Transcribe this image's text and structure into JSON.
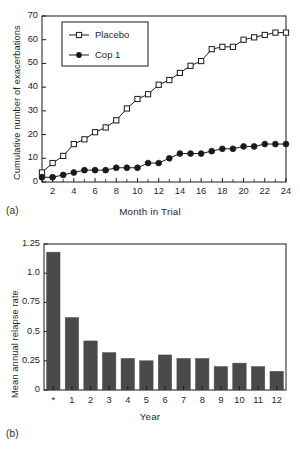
{
  "figure": {
    "panels": [
      {
        "id": "a",
        "label": "(a)"
      },
      {
        "id": "b",
        "label": "(b)"
      }
    ]
  },
  "chart_data": [
    {
      "type": "line",
      "panel": "(a)",
      "title": "",
      "xlabel": "Month in Trial",
      "ylabel": "Cumulative number of exacerbations",
      "xlim": [
        1,
        24
      ],
      "ylim": [
        0,
        70
      ],
      "ytick_values": [
        0,
        10,
        20,
        30,
        40,
        50,
        60,
        70
      ],
      "ytick_labels": [
        "0",
        "10",
        "20",
        "30",
        "40",
        "50",
        "60",
        "70"
      ],
      "xtick_values": [
        2,
        4,
        6,
        8,
        10,
        12,
        14,
        16,
        18,
        20,
        22,
        24
      ],
      "xtick_labels": [
        "2",
        "4",
        "6",
        "8",
        "10",
        "12",
        "14",
        "16",
        "18",
        "20",
        "22",
        "24"
      ],
      "xtick_minor_values": [
        1,
        3,
        5,
        7,
        9,
        11,
        13,
        15,
        17,
        19,
        21,
        23
      ],
      "grid": false,
      "legend_position": "upper left",
      "x": [
        1,
        2,
        3,
        4,
        5,
        6,
        7,
        8,
        9,
        10,
        11,
        12,
        13,
        14,
        15,
        16,
        17,
        18,
        19,
        20,
        21,
        22,
        23,
        24
      ],
      "series": [
        {
          "name": "Placebo",
          "marker": "open-square",
          "values": [
            4,
            8,
            11,
            16,
            18,
            21,
            23,
            26,
            31,
            35,
            37,
            41,
            43,
            46,
            49,
            51,
            56,
            57,
            57,
            60,
            61,
            62,
            63,
            63
          ]
        },
        {
          "name": "Cop 1",
          "marker": "filled-circle",
          "values": [
            2,
            2,
            3,
            4,
            5,
            5,
            5,
            6,
            6,
            6,
            8,
            8,
            10,
            12,
            12,
            12,
            13,
            14,
            14,
            15,
            15,
            16,
            16,
            16
          ]
        }
      ]
    },
    {
      "type": "bar",
      "panel": "(b)",
      "title": "",
      "xlabel": "Year",
      "ylabel": "Mean annual relapse rate",
      "ylim": [
        0,
        1.25
      ],
      "ytick_values": [
        0,
        0.25,
        0.5,
        0.75,
        1.0,
        1.25
      ],
      "ytick_labels": [
        "0",
        "0.25",
        "0.5",
        "0.75",
        "1.0",
        "1.25"
      ],
      "grid": false,
      "bar_color": "#4a4a4a",
      "categories": [
        "*",
        "1",
        "2",
        "3",
        "4",
        "5",
        "6",
        "7",
        "8",
        "9",
        "10",
        "11",
        "12"
      ],
      "values": [
        1.18,
        0.62,
        0.42,
        0.32,
        0.27,
        0.25,
        0.3,
        0.27,
        0.27,
        0.2,
        0.23,
        0.2,
        0.16
      ]
    }
  ],
  "colors": {
    "axis": "#1a1a1a",
    "line": "#1a1a1a",
    "bar": "#4a4a4a",
    "background": "#ffffff"
  }
}
